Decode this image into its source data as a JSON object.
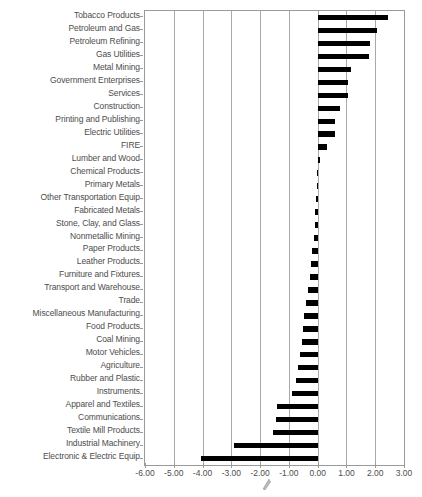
{
  "chart_data": {
    "type": "bar",
    "orientation": "horizontal",
    "title": "",
    "xlabel": "",
    "ylabel": "",
    "xlim": [
      -6.0,
      3.0
    ],
    "xticks": [
      "-6.00",
      "-5.00",
      "-4.00",
      "-3.00",
      "-2.00",
      "-1.00",
      "0.00",
      "1.00",
      "2.00",
      "3.00"
    ],
    "xtick_values": [
      -6,
      -5,
      -4,
      -3,
      -2,
      -1,
      0,
      1,
      2,
      3
    ],
    "grid": true,
    "legend": "none",
    "bar_color": "#000000",
    "axis_color": "#9a9a9a",
    "categories": [
      "Tobacco Products",
      "Petroleum and Gas",
      "Petroleum Refining",
      "Gas Utilities",
      "Metal Mining",
      "Government Enterprises",
      "Services",
      "Construction",
      "Printing and Publishing",
      "Electric Utilities",
      "FIRE",
      "Lumber and Wood",
      "Chemical Products",
      "Primary Metals",
      "Other Transportation Equip",
      "Fabricated Metals",
      "Stone, Clay, and Glass",
      "Nonmetallic Mining",
      "Paper Products",
      "Leather Products",
      "Furniture and Fixtures",
      "Transport and Warehouse",
      "Trade",
      "Miscellaneous Manufacturing",
      "Food Products",
      "Coal Mining",
      "Motor Vehicles",
      "Agriculture",
      "Rubber and Plastic",
      "Instruments",
      "Apparel and Textiles",
      "Communications",
      "Textile Mill Products",
      "Industrial Machinery",
      "Electronic & Electric Equip"
    ],
    "values": [
      2.45,
      2.07,
      1.83,
      1.79,
      1.17,
      1.07,
      1.05,
      0.79,
      0.59,
      0.59,
      0.31,
      0.07,
      -0.02,
      -0.04,
      -0.06,
      -0.08,
      -0.1,
      -0.14,
      -0.2,
      -0.24,
      -0.28,
      -0.34,
      -0.41,
      -0.48,
      -0.52,
      -0.55,
      -0.62,
      -0.69,
      -0.76,
      -0.9,
      -1.41,
      -1.45,
      -1.55,
      -2.9,
      -4.05
    ]
  }
}
